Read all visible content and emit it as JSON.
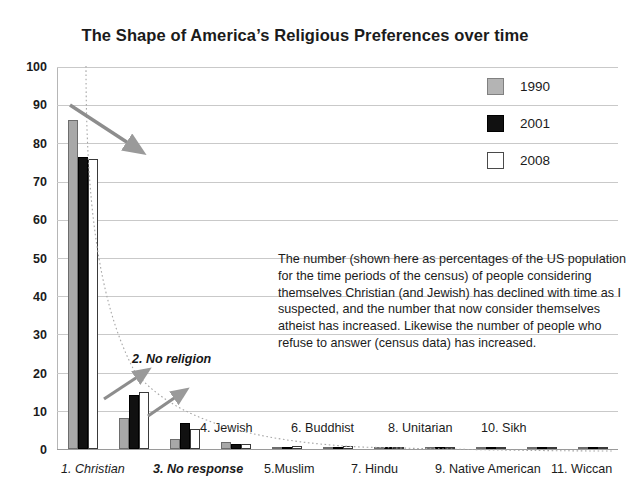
{
  "chart_data": {
    "type": "bar",
    "title": "The Shape of America’s Religious Preferences over time",
    "xlabel": "",
    "ylabel": "",
    "ylim": [
      0,
      100
    ],
    "yticks": [
      0,
      10,
      20,
      30,
      40,
      50,
      60,
      70,
      80,
      90,
      100
    ],
    "grid": true,
    "legend_position": "top-right",
    "categories": [
      "1. Christian",
      "2. No religion",
      "3. No response",
      "4. Jewish",
      "5. Muslim",
      "6. Buddhist",
      "7. Hindu",
      "8. Unitarian",
      "9. Native American",
      "10. Sikh",
      "11. Wiccan"
    ],
    "series": [
      {
        "name": "1990",
        "color": "#a8a8a8",
        "values": [
          86.2,
          8.2,
          2.7,
          1.8,
          0.5,
          0.4,
          0.3,
          0.3,
          0.2,
          0.2,
          0.1
        ]
      },
      {
        "name": "2001",
        "color": "#111111",
        "values": [
          76.5,
          14.2,
          6.9,
          1.4,
          0.6,
          0.6,
          0.4,
          0.4,
          0.5,
          0.3,
          0.2
        ]
      },
      {
        "name": "2008",
        "color": "#ffffff",
        "values": [
          76.0,
          15.0,
          5.3,
          1.2,
          0.7,
          0.7,
          0.5,
          0.4,
          0.4,
          0.3,
          0.3
        ]
      }
    ],
    "annotations": [
      {
        "name": "no-religion-callout",
        "text": "2. No religion"
      },
      {
        "name": "explanatory-note",
        "text": "The number (shown here as percentages of the US population for the time periods of the census) of people considering themselves Christian (and Jewish) has declined  with time as I suspected, and the number that now consider themselves atheist has increased. Likewise the number of people who refuse to answer (census data) has increased."
      }
    ]
  },
  "legend": {
    "items": [
      {
        "label": "1990",
        "swatch": "gray-swatch-icon"
      },
      {
        "label": "2001",
        "swatch": "black-swatch-icon"
      },
      {
        "label": "2008",
        "swatch": "white-swatch-icon"
      }
    ]
  },
  "axis": {
    "y_labels": [
      "100",
      "90",
      "80",
      "70",
      "60",
      "50",
      "40",
      "30",
      "20",
      "10",
      "0"
    ]
  },
  "category_labels": {
    "top_row": [
      {
        "text": "4. Jewish",
        "style": "plain"
      },
      {
        "text": "6. Buddhist",
        "style": "plain"
      },
      {
        "text": "8. Unitarian",
        "style": "plain"
      },
      {
        "text": "10. Sikh",
        "style": "plain"
      }
    ],
    "bottom_row": [
      {
        "text": "1. Christian",
        "style": "italic"
      },
      {
        "text": "3. No response",
        "style": "bold-italic"
      },
      {
        "text": "5.Muslim",
        "style": "plain"
      },
      {
        "text": "7. Hindu",
        "style": "plain"
      },
      {
        "text": "9. Native American",
        "style": "plain"
      },
      {
        "text": "11. Wiccan",
        "style": "plain"
      }
    ]
  },
  "callout": {
    "no_religion": "2. No religion"
  },
  "note": {
    "text": "The number (shown here as percentages of the US population for the time periods of the census) of people considering themselves Christian (and Jewish) has declined  with time as I suspected, and the number that now consider themselves atheist has increased. Likewise the number of people who refuse to answer (census data) has increased."
  },
  "colors": {
    "series_1990": "#a8a8a8",
    "series_2001": "#111111",
    "series_2008": "#ffffff",
    "gridline": "#c9c9c9",
    "text": "#1b1b1b"
  }
}
